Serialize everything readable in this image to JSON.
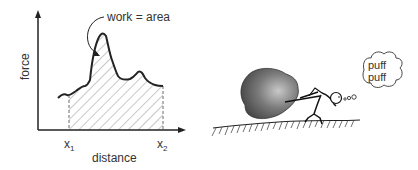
{
  "left_figure": {
    "y_axis_label": "force",
    "x_axis_label": "distance",
    "x1_label": "x",
    "x1_sub": "1",
    "x2_label": "x",
    "x2_sub": "2",
    "annotation": "work = area"
  },
  "right_figure": {
    "thought_line1": "puff",
    "thought_line2": "puff"
  }
}
